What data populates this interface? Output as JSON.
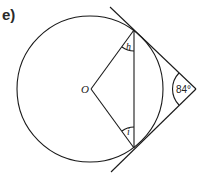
{
  "question": {
    "part_label": "e)"
  },
  "diagram": {
    "center_label": "O",
    "angle_top_label": "h",
    "angle_bottom_label": "i",
    "external_angle_label": "84°",
    "stroke_color": "#1a1a1a"
  }
}
